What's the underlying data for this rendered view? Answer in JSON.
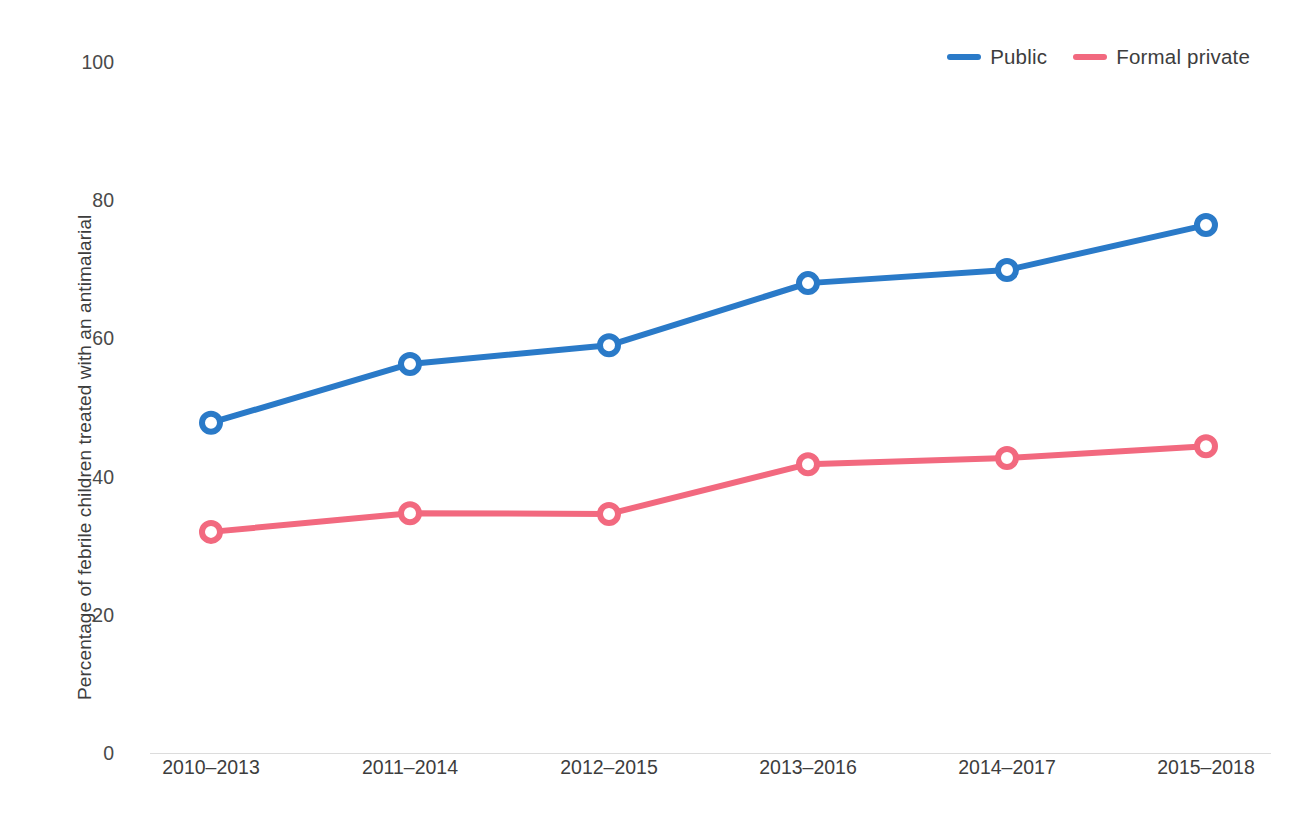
{
  "chart_data": {
    "type": "line",
    "title": "",
    "xlabel": "",
    "ylabel": "Percentage of febrile children treated with an antimalarial",
    "categories": [
      "2010–2013",
      "2011–2014",
      "2012–2015",
      "2013–2016",
      "2014–2017",
      "2015–2018"
    ],
    "series": [
      {
        "name": "Public",
        "color": "#2a7ac8",
        "values": [
          47.8,
          56.3,
          59.0,
          68.0,
          69.9,
          76.4
        ]
      },
      {
        "name": "Formal private",
        "color": "#f2697f",
        "values": [
          32.0,
          34.7,
          34.6,
          41.8,
          42.7,
          44.4
        ]
      }
    ],
    "yticks": [
      0,
      20,
      40,
      60,
      80,
      100
    ],
    "ylim": [
      0,
      100
    ],
    "grid": false,
    "legend_position": "top-right",
    "marker": "open-circle"
  },
  "axis": {
    "y_tick_labels": [
      "100",
      "80",
      "60",
      "40",
      "20",
      "0"
    ],
    "y_title": "Percentage of febrile children treated with an antimalarial"
  },
  "legend": {
    "items": [
      {
        "label": "Public",
        "color": "#2a7ac8"
      },
      {
        "label": "Formal private",
        "color": "#f2697f"
      }
    ]
  }
}
